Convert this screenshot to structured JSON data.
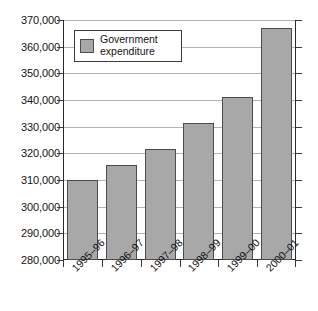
{
  "chart_data": {
    "type": "bar",
    "title": "",
    "subtitle": "",
    "xlabel": "",
    "ylabel": "",
    "categories": [
      "1995–96",
      "1996–97",
      "1997–98",
      "1998–99",
      "1999–00",
      "2000–01"
    ],
    "series": [
      {
        "name": "Government expenditure",
        "values": [
          310000,
          315500,
          321800,
          331200,
          341200,
          367000
        ]
      }
    ],
    "ylim": [
      280000,
      370000
    ],
    "ytick_values": [
      280000,
      290000,
      300000,
      310000,
      320000,
      330000,
      340000,
      350000,
      360000,
      370000
    ],
    "ytick_labels": [
      "280,000",
      "290,000",
      "300,000",
      "310,000",
      "320,000",
      "330,000",
      "340,000",
      "350,000",
      "360,000",
      "370,000"
    ],
    "grid": true,
    "grid_axis": "y",
    "legend": {
      "position": "top-left-inside",
      "entries": [
        {
          "label": "Government expenditure",
          "color": "#a8a8a8"
        }
      ]
    },
    "annotations": [],
    "colors": {
      "bar_fill": "#a8a8a8",
      "bar_border": "#4c4c4c",
      "gridline": "#b4b4b4",
      "axis": "#2b2b2b",
      "text": "#141414",
      "background": "#ffffff"
    },
    "xlabel_rotation_deg": -45
  }
}
